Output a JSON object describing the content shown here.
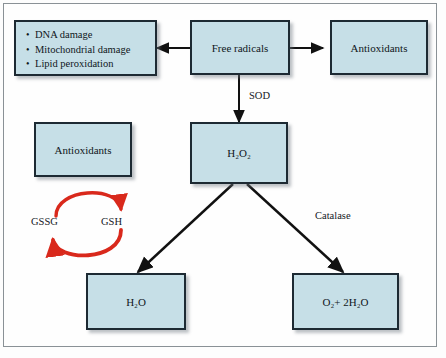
{
  "figure": {
    "background_color": "#fdfdfd",
    "box_fill_color": "#c6dfe7",
    "box_border_color": "#1d2a33",
    "arrow_color": "#111111",
    "cycle_arrow_color": "#d9291c"
  },
  "boxes": {
    "damage": {
      "name": "damage-effects",
      "bullets": [
        "DNA damage",
        "Mitochondrial damage",
        "Lipid peroxidation"
      ]
    },
    "free_radicals": {
      "label": "Free radicals"
    },
    "antioxidants_right": {
      "label": "Antioxidants"
    },
    "antioxidants_left": {
      "label": "Antioxidants"
    },
    "hydrogen_peroxide": {
      "label": "H2O2",
      "formula_html": "H₂O₂"
    },
    "water": {
      "label": "H2O",
      "formula_html": "H₂O"
    },
    "oxygen_water": {
      "label": "O2+ 2H2O",
      "formula_html": "O₂+ 2H₂O"
    }
  },
  "labels": {
    "sod": "SOD",
    "catalase": "Catalase",
    "gssg": "GSSG",
    "gsh": "GSH"
  },
  "arrows": [
    {
      "name": "free-radicals-to-damage",
      "from": "free_radicals",
      "to": "damage",
      "direction": "left"
    },
    {
      "name": "free-radicals-to-antioxidants",
      "from": "free_radicals",
      "to": "antioxidants_right",
      "direction": "right"
    },
    {
      "name": "free-radicals-to-h2o2",
      "from": "free_radicals",
      "to": "hydrogen_peroxide",
      "direction": "down",
      "label": "SOD"
    },
    {
      "name": "h2o2-to-water",
      "from": "hydrogen_peroxide",
      "to": "water",
      "direction": "down-left"
    },
    {
      "name": "h2o2-to-oxygen-water",
      "from": "hydrogen_peroxide",
      "to": "oxygen_water",
      "direction": "down-right",
      "label": "Catalase"
    },
    {
      "name": "gssg-to-gsh-cycle",
      "from": "gssg",
      "to": "gsh",
      "direction": "clockwise-top",
      "color": "#d9291c"
    },
    {
      "name": "gsh-to-gssg-cycle",
      "from": "gsh",
      "to": "gssg",
      "direction": "clockwise-bottom",
      "color": "#d9291c"
    }
  ]
}
